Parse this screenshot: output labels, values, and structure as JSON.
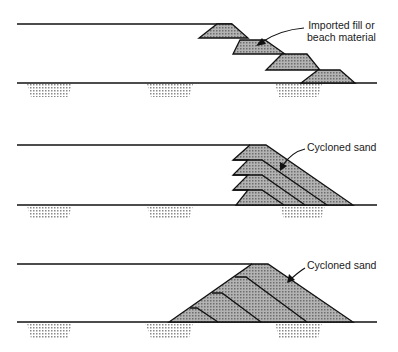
{
  "figure": {
    "panels": [
      {
        "id": "panel-1",
        "label_line1": "Imported fill or",
        "label_line2": "beach material"
      },
      {
        "id": "panel-2",
        "label_line1": "Cycloned sand"
      },
      {
        "id": "panel-3",
        "label_line1": "Cycloned sand"
      }
    ],
    "colors": {
      "line": "#111111",
      "fill": "#a9a9a9",
      "dots": "#7a7a7a",
      "background": "#ffffff"
    }
  }
}
